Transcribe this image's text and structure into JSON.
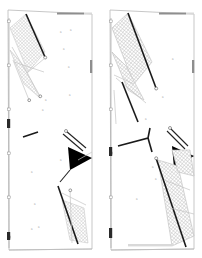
{
  "figure": {
    "background_color": "#ffffff",
    "width": 202,
    "height": 258,
    "ink_color": "#000000",
    "hatch_color": "#c9c9c9",
    "light_wall_color": "#bdbdbd",
    "accent_color": "#1a1a1a"
  },
  "panels": [
    {
      "id": "left-panel",
      "name": "Panel A",
      "x": 6,
      "y": 8,
      "width": 88,
      "height": 243,
      "regions": [
        {
          "name": "upper-diamond",
          "fill": "cross-hatch",
          "label": ""
        },
        {
          "name": "lower-quad",
          "fill": "cross-hatch",
          "label": ""
        }
      ],
      "arrows": [
        {
          "name": "flow-arrow",
          "direction": "right",
          "color": "#000000"
        }
      ],
      "marks": [
        "a",
        "a",
        "a",
        "a",
        "a",
        "a",
        "a",
        "a",
        "a"
      ]
    },
    {
      "id": "right-panel",
      "name": "Panel B",
      "x": 108,
      "y": 8,
      "width": 88,
      "height": 243,
      "regions": [
        {
          "name": "upper-diamond",
          "fill": "cross-hatch",
          "label": ""
        },
        {
          "name": "lower-band",
          "fill": "cross-hatch",
          "label": ""
        }
      ],
      "arrows": [
        {
          "name": "flow-arrow",
          "direction": "right",
          "color": "#000000"
        }
      ],
      "marks": [
        "a",
        "a",
        "a",
        "a",
        "a",
        "a"
      ]
    }
  ],
  "scale": {
    "name": "left-edge-ruler",
    "orientation": "vertical",
    "ticks": 6,
    "labels": []
  },
  "annotations": {
    "small_marks_text": "a",
    "mark_count_total": 15
  }
}
